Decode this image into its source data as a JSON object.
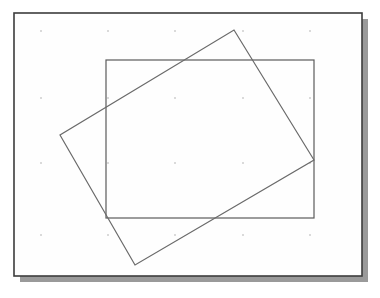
{
  "canvas": {
    "width": 380,
    "height": 298,
    "background_color": "#ffffff"
  },
  "panel": {
    "label": "figure-panel",
    "x": 14,
    "y": 13,
    "width": 348,
    "height": 263,
    "fill_color": "#fefefe",
    "border_color": "#3c3c3c",
    "border_width": 1.6
  },
  "shadow": {
    "label": "panel-drop-shadow",
    "offset_x": 6,
    "offset_y": 6,
    "color": "#9a9a9a"
  },
  "shapes": {
    "axis_aligned_rectangle": {
      "label": "axis-aligned-rectangle",
      "x": 106,
      "y": 60,
      "width": 208,
      "height": 158,
      "stroke_color": "#5a5a5a",
      "stroke_width": 1.2,
      "fill": "none",
      "corners": [
        [
          106,
          60
        ],
        [
          314,
          60
        ],
        [
          314,
          218
        ],
        [
          106,
          218
        ]
      ]
    },
    "rotated_quadrilateral": {
      "label": "rotated-rectangle",
      "stroke_color": "#6a6a6a",
      "stroke_width": 1.2,
      "fill": "none",
      "rotation_degrees": -21,
      "vertices": [
        [
          234,
          30
        ],
        [
          314,
          160
        ],
        [
          135,
          265
        ],
        [
          60,
          135
        ]
      ],
      "vertex_names": [
        "top-vertex",
        "right-vertex",
        "bottom-vertex",
        "left-vertex"
      ]
    }
  },
  "grid_marks": {
    "label": "faint-grid-dots",
    "color": "#b5b5b5",
    "size": 1.4,
    "x_positions": [
      41,
      108,
      175,
      243,
      310
    ],
    "y_positions": [
      31,
      98,
      163,
      235
    ]
  }
}
